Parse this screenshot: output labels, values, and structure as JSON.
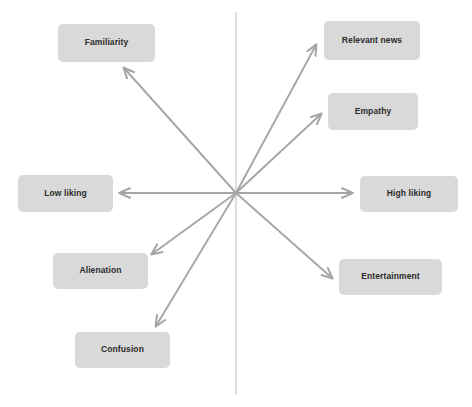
{
  "diagram": {
    "type": "radial-perceptual-map",
    "canvas": {
      "width": 472,
      "height": 407,
      "background": "#ffffff"
    },
    "colors": {
      "box_fill": "#d9d9d9",
      "box_text": "#2b2b2b",
      "arrow": "#a6a6a6",
      "axis_line": "#c9c9cc"
    },
    "center": {
      "x": 236,
      "y": 193
    },
    "vertical_axis": {
      "x": 236,
      "y_top": 12,
      "y_bottom": 395
    },
    "nodes": [
      {
        "id": "familiarity",
        "label": "Familiarity",
        "box": {
          "x": 58,
          "y": 24,
          "w": 97,
          "h": 38
        },
        "arrow_tip": {
          "x": 124,
          "y": 68
        },
        "direction": "upper-left"
      },
      {
        "id": "relevant-news",
        "label": "Relevant news",
        "box": {
          "x": 324,
          "y": 21,
          "w": 96,
          "h": 39
        },
        "arrow_tip": {
          "x": 316,
          "y": 45
        },
        "direction": "upper-right"
      },
      {
        "id": "empathy",
        "label": "Empathy",
        "box": {
          "x": 328,
          "y": 93,
          "w": 90,
          "h": 37
        },
        "arrow_tip": {
          "x": 321,
          "y": 114
        },
        "direction": "upper-right-shallow"
      },
      {
        "id": "low-liking",
        "label": "Low liking",
        "box": {
          "x": 18,
          "y": 175,
          "w": 95,
          "h": 37
        },
        "arrow_tip": {
          "x": 120,
          "y": 193
        },
        "direction": "left"
      },
      {
        "id": "high-liking",
        "label": "High liking",
        "box": {
          "x": 360,
          "y": 176,
          "w": 98,
          "h": 36
        },
        "arrow_tip": {
          "x": 352,
          "y": 193
        },
        "direction": "right"
      },
      {
        "id": "alienation",
        "label": "Alienation",
        "box": {
          "x": 53,
          "y": 253,
          "w": 95,
          "h": 36
        },
        "arrow_tip": {
          "x": 152,
          "y": 254
        },
        "direction": "lower-left-shallow"
      },
      {
        "id": "entertainment",
        "label": "Entertainment",
        "box": {
          "x": 339,
          "y": 259,
          "w": 103,
          "h": 36
        },
        "arrow_tip": {
          "x": 332,
          "y": 278
        },
        "direction": "lower-right"
      },
      {
        "id": "confusion",
        "label": "Confusion",
        "box": {
          "x": 75,
          "y": 332,
          "w": 95,
          "h": 36
        },
        "arrow_tip": {
          "x": 156,
          "y": 326
        },
        "direction": "lower-left-steep"
      }
    ]
  }
}
